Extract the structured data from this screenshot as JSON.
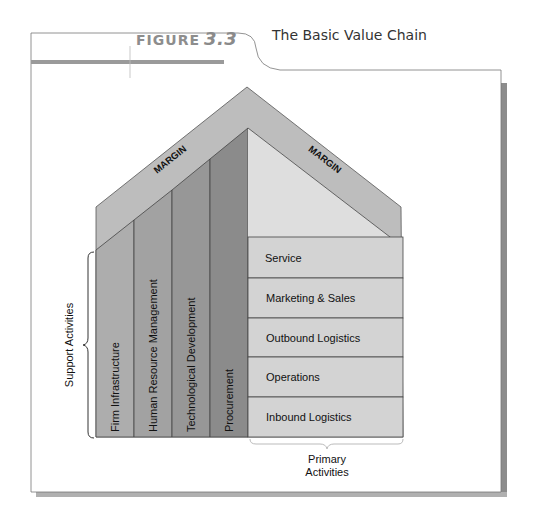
{
  "header": {
    "figure_label": "FIGURE",
    "figure_number": "3.3",
    "title": "The Basic Value Chain"
  },
  "diagram": {
    "margin_label_left": "MARGIN",
    "margin_label_right": "MARGIN",
    "support_activities": {
      "group_label": "Support Activities",
      "items": [
        {
          "label": "Firm Infrastructure"
        },
        {
          "label": "Human Resource Management"
        },
        {
          "label": "Technological Development"
        },
        {
          "label": "Procurement"
        }
      ]
    },
    "primary_activities": {
      "group_label_line1": "Primary",
      "group_label_line2": "Activities",
      "items": [
        {
          "label": "Service"
        },
        {
          "label": "Marketing & Sales"
        },
        {
          "label": "Outbound Logistics"
        },
        {
          "label": "Operations"
        },
        {
          "label": "Inbound Logistics"
        }
      ]
    },
    "colors": {
      "margin_band": "#bdbdbd",
      "support_col_1": "#adadad",
      "support_col_2": "#a2a2a2",
      "support_col_3": "#979797",
      "support_col_4": "#8b8b8b",
      "primary_fill": "#d3d3d3",
      "primary_roof": "#dcdcdc",
      "header_rule": "#9a9a9a",
      "frame_shadow": "#8c8c8c"
    }
  }
}
